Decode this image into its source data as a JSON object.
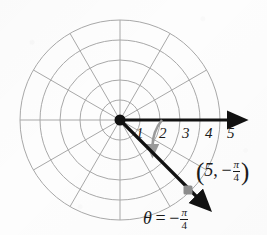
{
  "figure": {
    "background_color": "#fdfdfd",
    "grid": {
      "color": "#a8a8a8",
      "circle_count": 5,
      "spoke_count": 12,
      "spoke_step_degrees": 30,
      "pole_x": 120,
      "pole_y": 120,
      "outer_radius": 100,
      "ring_radii": [
        20,
        40,
        60,
        80,
        100
      ]
    },
    "polar_axis": {
      "color": "#111111",
      "label": "polar-axis",
      "from_x": 120,
      "from_y": 120,
      "to_x": 236,
      "to_y": 120
    },
    "radial_ticks": {
      "values": [
        "1",
        "2",
        "3",
        "4",
        "5"
      ],
      "positions_x": [
        137,
        160,
        183,
        206,
        228
      ],
      "position_y": 128
    },
    "ray": {
      "color": "#111111",
      "angle_degrees": -45,
      "from_x": 120,
      "from_y": 120,
      "to_x": 203,
      "to_y": 203
    },
    "point_marker": {
      "color": "#8c8c8c",
      "x": 188,
      "y": 190,
      "size": 9
    },
    "angle_arc": {
      "color": "#9a9a9a",
      "radius": 42,
      "start_degrees": 0,
      "end_degrees": -45,
      "arrow_x": 155,
      "arrow_y": 149
    },
    "labels": {
      "point": {
        "text_full": "(5, -pi/4)",
        "open_paren": "(",
        "radius_value": "5",
        "comma": ",",
        "minus": "−",
        "numerator": "π",
        "denominator": "4",
        "close_paren": ")",
        "x": 196,
        "y": 158
      },
      "theta": {
        "text_full": "theta = -pi/4",
        "symbol": "θ",
        "equals": "=",
        "minus": "−",
        "numerator": "π",
        "denominator": "4",
        "x": 143,
        "y": 208
      }
    }
  }
}
